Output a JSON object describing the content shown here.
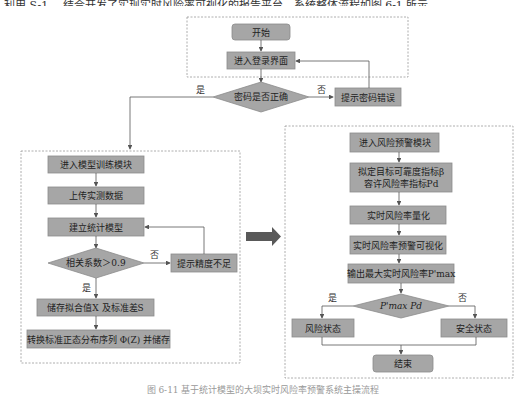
{
  "top_text": "利用 S-1 、结合开发了实现实时风险率可视化的报告平台，系统整体流程如图 6-1 所示。",
  "caption": "图 6-11  基于统计模型的大坝实时风险率预警系统主操流程",
  "login_module": {
    "start": "开始",
    "enter_login": "进入登录界面",
    "password_check": "密码是否正确",
    "password_error": "提示密码错误",
    "yes": "是",
    "no": "否"
  },
  "training_module": {
    "enter": "进入模型训练模块",
    "upload": "上传实测数据",
    "build_model": "建立统计模型",
    "correlation_check": "相关系数＞0.9",
    "low_precision": "提示精度不足",
    "store_fit": "储存拟合值X 及标准差S",
    "transform": "转换标准正态分布序列 Φ(Z) 并储存",
    "yes": "是",
    "no": "否"
  },
  "warning_module": {
    "enter": "进入风险预警模块",
    "set_indicators_line1": "拟定目标可靠度指标β",
    "set_indicators_line2": "容许风险率指标Pd",
    "quantify": "实时风险率量化",
    "visualize": "实时风险率预警可视化",
    "output_max": "输出最大实时风险率P'max",
    "compare": "P'max Pd",
    "risk_state": "风险状态",
    "safe_state": "安全状态",
    "end": "结束",
    "yes": "是",
    "no": "否"
  },
  "colors": {
    "box_fill": "#a6a6a6",
    "arrow_fill": "#595959",
    "dashed_border": "#999999"
  }
}
